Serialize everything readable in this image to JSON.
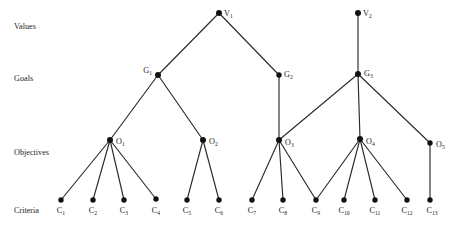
{
  "diagram": {
    "background": "#ffffff",
    "edge_color": "#2b2b2b",
    "node_color": "#111111",
    "text_color": "#1a1a1a",
    "width": 460,
    "height": 228,
    "row_labels": [
      {
        "id": "row-values",
        "text": "Values",
        "x": 14,
        "y": 29
      },
      {
        "id": "row-goals",
        "text": "Goals",
        "x": 14,
        "y": 81
      },
      {
        "id": "row-objectives",
        "text": "Objectives",
        "x": 14,
        "y": 155
      },
      {
        "id": "row-criteria",
        "text": "Criteria",
        "x": 14,
        "y": 213
      }
    ],
    "nodes": [
      {
        "id": "V1",
        "base": "V",
        "sub": "1",
        "x": 219,
        "y": 13,
        "r": 3.0,
        "label_x": 224,
        "label_y": 16,
        "anchor": "start"
      },
      {
        "id": "V2",
        "base": "V",
        "sub": "2",
        "x": 358,
        "y": 13,
        "r": 3.0,
        "label_x": 363,
        "label_y": 16,
        "anchor": "start"
      },
      {
        "id": "G1",
        "base": "G",
        "sub": "1",
        "x": 158,
        "y": 75,
        "r": 3.0,
        "label_x": 152,
        "label_y": 73,
        "anchor": "end"
      },
      {
        "id": "G2",
        "base": "G",
        "sub": "2",
        "x": 279,
        "y": 75,
        "r": 2.7,
        "label_x": 284,
        "label_y": 77,
        "anchor": "start"
      },
      {
        "id": "G3",
        "base": "G",
        "sub": "3",
        "x": 358,
        "y": 74,
        "r": 3.0,
        "label_x": 364,
        "label_y": 76,
        "anchor": "start"
      },
      {
        "id": "O1",
        "base": "O",
        "sub": "1",
        "x": 110,
        "y": 140,
        "r": 3.0,
        "label_x": 116,
        "label_y": 144,
        "anchor": "start"
      },
      {
        "id": "O2",
        "base": "O",
        "sub": "2",
        "x": 203,
        "y": 140,
        "r": 3.0,
        "label_x": 209,
        "label_y": 144,
        "anchor": "start"
      },
      {
        "id": "O3",
        "base": "O",
        "sub": "3",
        "x": 279,
        "y": 140,
        "r": 3.0,
        "label_x": 285,
        "label_y": 145,
        "anchor": "start"
      },
      {
        "id": "O4",
        "base": "O",
        "sub": "4",
        "x": 360,
        "y": 139,
        "r": 3.0,
        "label_x": 366,
        "label_y": 144,
        "anchor": "start"
      },
      {
        "id": "O5",
        "base": "O",
        "sub": "5",
        "x": 430,
        "y": 143,
        "r": 2.7,
        "label_x": 436,
        "label_y": 147,
        "anchor": "start"
      },
      {
        "id": "C1",
        "base": "C",
        "sub": "1",
        "x": 61,
        "y": 200,
        "r": 2.7,
        "label_x": 61,
        "label_y": 213,
        "anchor": "middle"
      },
      {
        "id": "C2",
        "base": "C",
        "sub": "2",
        "x": 93,
        "y": 200,
        "r": 2.7,
        "label_x": 93,
        "label_y": 213,
        "anchor": "middle"
      },
      {
        "id": "C3",
        "base": "C",
        "sub": "3",
        "x": 124,
        "y": 200,
        "r": 2.7,
        "label_x": 124,
        "label_y": 213,
        "anchor": "middle"
      },
      {
        "id": "C4",
        "base": "C",
        "sub": "4",
        "x": 156,
        "y": 199,
        "r": 2.7,
        "label_x": 156,
        "label_y": 213,
        "anchor": "middle"
      },
      {
        "id": "C5",
        "base": "C",
        "sub": "5",
        "x": 187,
        "y": 200,
        "r": 2.7,
        "label_x": 187,
        "label_y": 213,
        "anchor": "middle"
      },
      {
        "id": "C6",
        "base": "C",
        "sub": "6",
        "x": 219,
        "y": 200,
        "r": 2.7,
        "label_x": 219,
        "label_y": 213,
        "anchor": "middle"
      },
      {
        "id": "C7",
        "base": "C",
        "sub": "7",
        "x": 252,
        "y": 200,
        "r": 2.7,
        "label_x": 252,
        "label_y": 213,
        "anchor": "middle"
      },
      {
        "id": "C8",
        "base": "C",
        "sub": "8",
        "x": 283,
        "y": 200,
        "r": 2.7,
        "label_x": 283,
        "label_y": 213,
        "anchor": "middle"
      },
      {
        "id": "C9",
        "base": "C",
        "sub": "9",
        "x": 316,
        "y": 200,
        "r": 2.7,
        "label_x": 316,
        "label_y": 213,
        "anchor": "middle"
      },
      {
        "id": "C10",
        "base": "C",
        "sub": "10",
        "x": 344,
        "y": 200,
        "r": 2.7,
        "label_x": 344,
        "label_y": 213,
        "anchor": "middle"
      },
      {
        "id": "C11",
        "base": "C",
        "sub": "11",
        "x": 375,
        "y": 200,
        "r": 2.7,
        "label_x": 375,
        "label_y": 213,
        "anchor": "middle"
      },
      {
        "id": "C12",
        "base": "C",
        "sub": "12",
        "x": 407,
        "y": 200,
        "r": 2.7,
        "label_x": 407,
        "label_y": 213,
        "anchor": "middle"
      },
      {
        "id": "C13",
        "base": "C",
        "sub": "13",
        "x": 430,
        "y": 200,
        "r": 2.7,
        "label_x": 432,
        "label_y": 213,
        "anchor": "middle"
      }
    ],
    "edges": [
      {
        "from": "V1",
        "to": "G1"
      },
      {
        "from": "V1",
        "to": "G2"
      },
      {
        "from": "V2",
        "to": "G3"
      },
      {
        "from": "G1",
        "to": "O1"
      },
      {
        "from": "G1",
        "to": "O2"
      },
      {
        "from": "G2",
        "to": "O3"
      },
      {
        "from": "G3",
        "to": "O3"
      },
      {
        "from": "G3",
        "to": "O4"
      },
      {
        "from": "G3",
        "to": "O5"
      },
      {
        "from": "O1",
        "to": "C1"
      },
      {
        "from": "O1",
        "to": "C2"
      },
      {
        "from": "O1",
        "to": "C3"
      },
      {
        "from": "O1",
        "to": "C4"
      },
      {
        "from": "O2",
        "to": "C5"
      },
      {
        "from": "O2",
        "to": "C6"
      },
      {
        "from": "O3",
        "to": "C7"
      },
      {
        "from": "O3",
        "to": "C8"
      },
      {
        "from": "O3",
        "to": "C9"
      },
      {
        "from": "O4",
        "to": "C9"
      },
      {
        "from": "O4",
        "to": "C10"
      },
      {
        "from": "O4",
        "to": "C11"
      },
      {
        "from": "O4",
        "to": "C12"
      },
      {
        "from": "O5",
        "to": "C13"
      }
    ]
  }
}
